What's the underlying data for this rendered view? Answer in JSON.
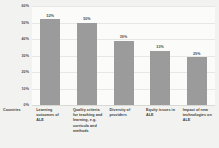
{
  "chart_data": {
    "type": "bar",
    "title": "",
    "subtitle": "",
    "xlabel": "Countries",
    "ylabel": "",
    "ylim": [
      0,
      60
    ],
    "grid": true,
    "legend": "none",
    "orientation": "vertical",
    "bar_color": "#9b9b9b",
    "background_color": "#f2f2f0",
    "plot_background_color": "#fbfbfa",
    "gridline_color": "#e7e7e4",
    "label_color": "#4a4a4a",
    "categories": [
      "Learning outcomes of ALE",
      "Quality criteria for teaching and learning, e.g. curricula and methods",
      "Diversity of providers",
      "Equity issues in ALE",
      "Impact of new technologies on ALE"
    ],
    "values": [
      52,
      50,
      39,
      33,
      29
    ],
    "value_labels": [
      "52%",
      "50%",
      "39%",
      "33%",
      "29%"
    ],
    "yticks": [
      60,
      50,
      40,
      30,
      20,
      10,
      0
    ],
    "ytick_labels": [
      "60%",
      "50%",
      "40%",
      "30%",
      "20%",
      "10%",
      "0%"
    ]
  }
}
